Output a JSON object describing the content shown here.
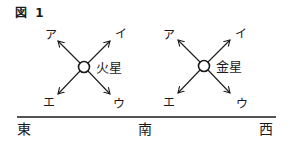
{
  "figure": {
    "title": "図 1"
  },
  "planets": [
    {
      "name": "火星",
      "arrows": {
        "upper_left": "ア",
        "upper_right": "イ",
        "lower_right": "ウ",
        "lower_left": "エ"
      }
    },
    {
      "name": "金星",
      "arrows": {
        "upper_left": "ア",
        "upper_right": "イ",
        "lower_right": "ウ",
        "lower_left": "エ"
      }
    }
  ],
  "horizon": {
    "directions": [
      "東",
      "南",
      "西"
    ]
  }
}
